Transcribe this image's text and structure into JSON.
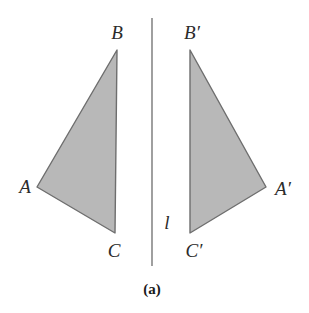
{
  "figure": {
    "caption": "(a)",
    "background_color": "#ffffff",
    "stroke_color": "#6e6e6e",
    "fill_color": "#b8b8b8",
    "label_color": "#2b2b2b",
    "mirror_line": {
      "label": "l",
      "label_x": 167,
      "label_y": 222,
      "x": 152,
      "y1": 18,
      "y2": 266,
      "color": "#888888",
      "width": 1.6
    },
    "caption_x": 152,
    "caption_y": 289,
    "shapes": [
      {
        "name": "triangle-abc",
        "points": "117,50 37,187 115,233",
        "vertices": [
          {
            "name": "B",
            "label": "B",
            "x": 117,
            "y": 50,
            "label_x": 117,
            "label_y": 32
          },
          {
            "name": "A",
            "label": "A",
            "x": 37,
            "y": 187,
            "label_x": 25,
            "label_y": 186
          },
          {
            "name": "C",
            "label": "C",
            "x": 115,
            "y": 233,
            "label_x": 114,
            "label_y": 250
          }
        ]
      },
      {
        "name": "triangle-abc-prime",
        "points": "190,50 266,187 190,233",
        "vertices": [
          {
            "name": "B-prime",
            "label": "B′",
            "x": 190,
            "y": 50,
            "label_x": 192,
            "label_y": 32
          },
          {
            "name": "A-prime",
            "label": "A′",
            "x": 266,
            "y": 187,
            "label_x": 283,
            "label_y": 188
          },
          {
            "name": "C-prime",
            "label": "C′",
            "x": 190,
            "y": 233,
            "label_x": 194,
            "label_y": 250
          }
        ]
      }
    ]
  },
  "chart_data": {
    "type": "diagram",
    "title": "(a)",
    "elements": [
      {
        "kind": "polygon",
        "id": "ABC",
        "vertices": {
          "A": [
            37,
            187
          ],
          "B": [
            117,
            50
          ],
          "C": [
            115,
            233
          ]
        }
      },
      {
        "kind": "polygon",
        "id": "A'B'C'",
        "vertices": {
          "A'": [
            266,
            187
          ],
          "B'": [
            190,
            50
          ],
          "C'": [
            190,
            233
          ]
        }
      },
      {
        "kind": "line",
        "id": "l",
        "from": [
          152,
          18
        ],
        "to": [
          152,
          266
        ]
      }
    ],
    "labels": [
      "A",
      "B",
      "C",
      "A′",
      "B′",
      "C′",
      "l",
      "(a)"
    ]
  }
}
